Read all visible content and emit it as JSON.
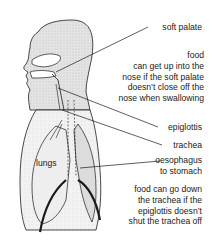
{
  "diagram": {
    "labels": {
      "soft_palate": "soft palate",
      "epiglottis": "epiglottis",
      "trachea": "trachea",
      "oesophagus_line1": "oesophagus",
      "oesophagus_line2": "to stomach",
      "lungs": "lungs"
    },
    "notes": {
      "nose": [
        "food",
        "can get up into the",
        "nose if the soft palate",
        "doesn’t close off the",
        "nose when swallowing"
      ],
      "trachea": [
        "food can go down",
        "the trachea if the",
        "epiglottis doesn’t",
        "shut the trachea off"
      ]
    },
    "colors": {
      "line": "#1a1a1a",
      "shading": "#d9d9d9",
      "background": "#ffffff"
    }
  }
}
